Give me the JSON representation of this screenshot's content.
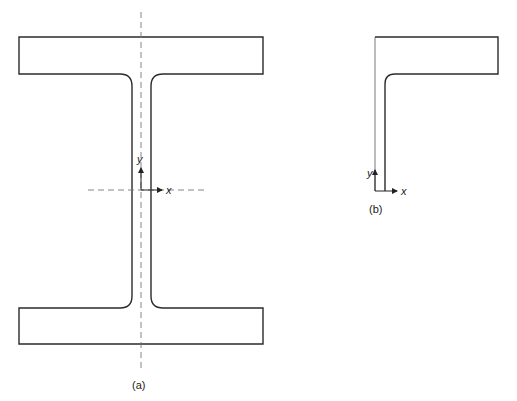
{
  "figure_a": {
    "caption": "(a)",
    "shape": "I-beam cross-section",
    "axes": {
      "x_label": "x",
      "y_label": "y"
    }
  },
  "figure_b": {
    "caption": "(b)",
    "shape": "angle section (half flange + web)",
    "axes": {
      "x_label": "x",
      "y_label": "y"
    }
  },
  "colors": {
    "line": "#2b2b2b",
    "dashed": "#777777",
    "background": "#ffffff"
  }
}
